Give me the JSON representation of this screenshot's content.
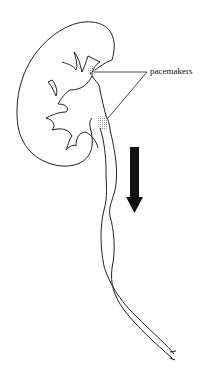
{
  "diagram": {
    "labels": {
      "pacemakers": "pacemakers"
    },
    "arrow": {
      "direction": "down",
      "color": "#111111"
    },
    "colors": {
      "line": "#222222",
      "stipple": "#999999",
      "background": "#ffffff"
    }
  }
}
